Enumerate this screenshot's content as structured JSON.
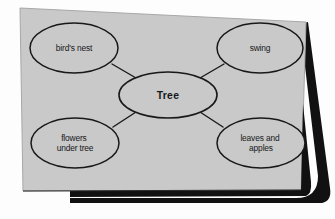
{
  "document": {
    "type": "concept-map",
    "title": "Tree concept map",
    "page_color": "#c9c9c9",
    "ink_color": "#17181a",
    "shadow_color": "#111111",
    "paper_edge_color": "#8f8f8f"
  },
  "map": {
    "center": {
      "id": "tree",
      "label": "Tree",
      "lines": [
        "Tree"
      ],
      "cx": 168,
      "cy": 95,
      "rx": 49,
      "ry": 23
    },
    "nodes": [
      {
        "id": "birds-nest",
        "label": "bird's nest",
        "lines": [
          "bird's nest"
        ],
        "cx": 74,
        "cy": 48,
        "rx": 44,
        "ry": 25
      },
      {
        "id": "swing",
        "label": "swing",
        "lines": [
          "swing"
        ],
        "cx": 260,
        "cy": 48,
        "rx": 43,
        "ry": 25
      },
      {
        "id": "flowers-under-tree",
        "label": "flowers under tree",
        "lines": [
          "flowers",
          "under tree"
        ],
        "cx": 75,
        "cy": 143,
        "rx": 44,
        "ry": 25
      },
      {
        "id": "leaves-and-apples",
        "label": "leaves and apples",
        "lines": [
          "leaves and",
          "apples"
        ],
        "cx": 261,
        "cy": 143,
        "rx": 44,
        "ry": 25
      }
    ],
    "connectors": [
      {
        "id": "tree-to-birds-nest",
        "from": "tree",
        "to": "birds-nest",
        "x1": 136,
        "y1": 78,
        "x2": 112,
        "y2": 64
      },
      {
        "id": "tree-to-swing",
        "from": "tree",
        "to": "swing",
        "x1": 200,
        "y1": 78,
        "x2": 224,
        "y2": 64
      },
      {
        "id": "tree-to-flowers",
        "from": "tree",
        "to": "flowers-under-tree",
        "x1": 136,
        "y1": 112,
        "x2": 113,
        "y2": 127
      },
      {
        "id": "tree-to-leaves",
        "from": "tree",
        "to": "leaves-and-apples",
        "x1": 200,
        "y1": 112,
        "x2": 223,
        "y2": 127
      }
    ]
  }
}
